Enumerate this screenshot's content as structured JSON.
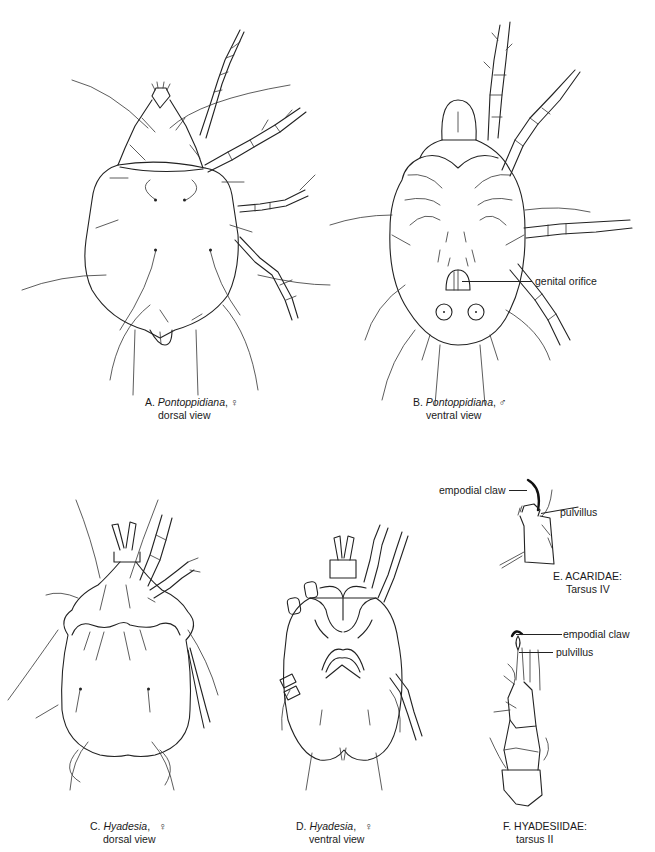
{
  "figure": {
    "panels": [
      {
        "id": "A",
        "letter": "A.",
        "genus": "Pontoppidiana",
        "sex_symbol": "♀",
        "view": "dorsal view"
      },
      {
        "id": "B",
        "letter": "B.",
        "genus": "Pontoppidiana",
        "sex_symbol": "♂",
        "view": "ventral view",
        "callouts": [
          "genital orifice"
        ]
      },
      {
        "id": "C",
        "letter": "C.",
        "genus": "Hyadesia",
        "sex_symbol": "♀",
        "view": "dorsal view"
      },
      {
        "id": "D",
        "letter": "D.",
        "genus": "Hyadesia",
        "sex_symbol": "♀",
        "view": "ventral view"
      },
      {
        "id": "E",
        "letter": "E.",
        "family": "ACARIDAE:",
        "part": "Tarsus IV",
        "callouts": [
          "empodial claw",
          "pulvillus"
        ]
      },
      {
        "id": "F",
        "letter": "F.",
        "family": "HYADESIIDAE:",
        "part": "tarsus II",
        "callouts": [
          "empodial claw",
          "pulvillus"
        ]
      }
    ]
  }
}
